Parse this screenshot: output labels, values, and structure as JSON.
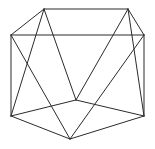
{
  "figure": {
    "kind": "wireframe-polyhedron-line-drawing",
    "canvas": {
      "width": 155,
      "height": 149,
      "background": "#ffffff"
    },
    "stroke": {
      "color": "#2b2b2b",
      "width": 1
    },
    "vertices": [
      {
        "id": "top-left",
        "label": "A",
        "x": 44,
        "y": 9
      },
      {
        "id": "top-right",
        "label": "B",
        "x": 128,
        "y": 9
      },
      {
        "id": "left-upper",
        "label": "C",
        "x": 11,
        "y": 35
      },
      {
        "id": "right-upper",
        "label": "D",
        "x": 144,
        "y": 35
      },
      {
        "id": "left-lower",
        "label": "E",
        "x": 11,
        "y": 116
      },
      {
        "id": "right-lower",
        "label": "F",
        "x": 144,
        "y": 116
      },
      {
        "id": "center",
        "label": "G",
        "x": 76,
        "y": 100
      },
      {
        "id": "bottom-center",
        "label": "H",
        "x": 70,
        "y": 139
      }
    ],
    "edges": [
      {
        "id": "edge-top-ridge",
        "from": "top-left",
        "to": "top-right"
      },
      {
        "id": "edge-topleft-leftupper",
        "from": "top-left",
        "to": "left-upper"
      },
      {
        "id": "edge-topright-rightupper",
        "from": "top-right",
        "to": "right-upper"
      },
      {
        "id": "edge-upper-horizontal",
        "from": "left-upper",
        "to": "right-upper"
      },
      {
        "id": "edge-leftupper-leftlower",
        "from": "left-upper",
        "to": "left-lower"
      },
      {
        "id": "edge-rightupper-rightlower",
        "from": "right-upper",
        "to": "right-lower"
      },
      {
        "id": "edge-leftlower-bottomctr",
        "from": "left-lower",
        "to": "bottom-center"
      },
      {
        "id": "edge-rightlower-bottomctr",
        "from": "right-lower",
        "to": "bottom-center"
      },
      {
        "id": "edge-leftlower-center",
        "from": "left-lower",
        "to": "center"
      },
      {
        "id": "edge-rightlower-center",
        "from": "right-lower",
        "to": "center"
      },
      {
        "id": "edge-topleft-center",
        "from": "top-left",
        "to": "center"
      },
      {
        "id": "edge-topright-center",
        "from": "top-right",
        "to": "center"
      },
      {
        "id": "edge-topleft-leftlower",
        "from": "top-left",
        "to": "left-lower"
      },
      {
        "id": "edge-topright-rightlower",
        "from": "top-right",
        "to": "right-lower"
      },
      {
        "id": "edge-leftupper-bottomctr",
        "from": "left-upper",
        "to": "bottom-center"
      },
      {
        "id": "edge-rightupper-bottomctr",
        "from": "right-upper",
        "to": "bottom-center"
      }
    ]
  }
}
